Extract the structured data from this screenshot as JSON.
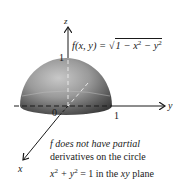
{
  "figure": {
    "axes": {
      "z_label": "z",
      "y_label": "y",
      "x_label": "x",
      "origin_label": "0",
      "z_tick_label": "1",
      "y_tick_label": "1"
    },
    "function_label": {
      "lhs": "f(x, y) = ",
      "radical": "√",
      "radicand_prefix": "1 − x",
      "exp1": "2",
      "radicand_mid": " − y",
      "exp2": "2"
    },
    "caption": {
      "line1": "f does not have partial",
      "line2": "derivatives on the circle",
      "line3_x": "x",
      "line3_exp1": "2",
      "line3_plus": " + y",
      "line3_exp2": "2",
      "line3_rest": " = 1 in the ",
      "line3_xy": "xy",
      "line3_end": " plane"
    },
    "colors": {
      "surface_light": "#d4d4d4",
      "surface_mid": "#8c8c8c",
      "surface_dark": "#3c3c3c",
      "axis": "#1a1a1a"
    }
  }
}
